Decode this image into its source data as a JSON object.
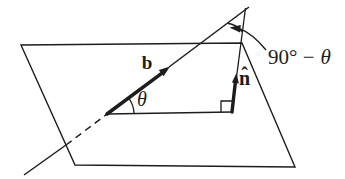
{
  "figure": {
    "labels": {
      "vector_b": "b",
      "theta": "θ",
      "normal_letter": "n",
      "normal_hat": "ˆ",
      "complement_prefix": "90° −",
      "complement_theta": "θ"
    },
    "colors": {
      "ink": "#1d1d1b",
      "background": "#ffffff"
    }
  }
}
